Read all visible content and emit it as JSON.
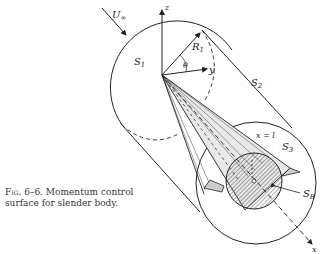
{
  "figure": {
    "caption_prefix": "Fig.",
    "caption_number": "6–6.",
    "caption_line1": "Momentum control",
    "caption_line2": "surface for slender body."
  },
  "labels": {
    "freestream": "U",
    "freestream_sub": "∞",
    "z_axis": "z",
    "y_axis": "y",
    "x_axis": "x",
    "radius": "R",
    "radius_sub": "1",
    "angle": "θ",
    "s1": "S",
    "s1_sub": "1",
    "s2": "S",
    "s2_sub": "2",
    "s3": "S",
    "s3_sub": "3",
    "sb": "S",
    "sb_sub": "B",
    "station": "x = l"
  },
  "colors": {
    "ink": "#222222",
    "hatch": "#555555",
    "background": "#ffffff"
  }
}
